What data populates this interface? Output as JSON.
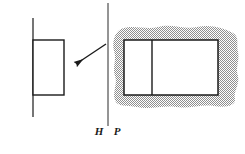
{
  "figure": {
    "canvas": {
      "width": 245,
      "height": 154,
      "background": "#ffffff"
    },
    "colors": {
      "stroke": "#1a1a1a",
      "thin_stroke": "#2b2b2b",
      "shading": "#9a9a9a",
      "fill_white": "#ffffff"
    },
    "axis": {
      "label_left": "H",
      "label_right": "P",
      "label_left_x": 99,
      "label_right_x": 114,
      "label_y": 131,
      "line_x": 108,
      "line_y_top": 3,
      "line_y_bottom": 126,
      "line_width": 1
    },
    "object": {
      "name": "object-rectangle",
      "x": 33,
      "y": 40,
      "width": 31,
      "height": 55,
      "stroke_width": 1.4,
      "vertical_line": {
        "name": "object-axis-line",
        "x": 33,
        "y_top": 18,
        "y_bottom": 117,
        "line_width": 1.2
      }
    },
    "arrow": {
      "name": "direction-arrow",
      "tail_x": 106,
      "tail_y": 44,
      "tip_x": 73,
      "tip_y": 66,
      "line_width": 1.2,
      "head_length": 9,
      "head_width": 5
    },
    "image_region": {
      "name": "shaded-blob",
      "fill": "#9a9a9a",
      "pattern": "checker-dither",
      "bounds": {
        "x": 113,
        "y": 26,
        "width": 128,
        "height": 83
      }
    },
    "image_rectangle": {
      "name": "image-rectangle",
      "x": 124,
      "y": 40,
      "width": 94,
      "height": 55,
      "stroke_width": 1.4,
      "fill": "#ffffff",
      "divider": {
        "name": "image-divider-line",
        "x": 152,
        "line_width": 1.4
      }
    }
  }
}
